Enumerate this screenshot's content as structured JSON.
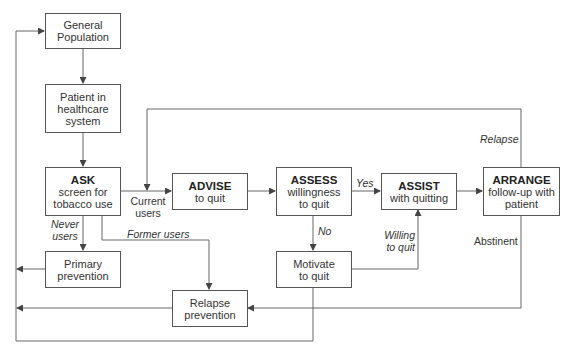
{
  "diagram": {
    "type": "flowchart",
    "nodes": {
      "general_population": {
        "line1": "General",
        "line2": "Population"
      },
      "patient": {
        "line1": "Patient in",
        "line2": "healthcare",
        "line3": "system"
      },
      "ask": {
        "title": "ASK",
        "line1": "screen for",
        "line2": "tobacco use"
      },
      "primary_prevention": {
        "line1": "Primary",
        "line2": "prevention"
      },
      "advise": {
        "title": "ADVISE",
        "line1": "to quit"
      },
      "relapse_prevention": {
        "line1": "Relapse",
        "line2": "prevention"
      },
      "assess": {
        "title": "ASSESS",
        "line1": "willingness",
        "line2": "to quit"
      },
      "motivate": {
        "line1": "Motivate",
        "line2": "to quit"
      },
      "assist": {
        "title": "ASSIST",
        "line1": "with quitting"
      },
      "arrange": {
        "title": "ARRANGE",
        "line1": "follow-up with",
        "line2": "patient"
      }
    },
    "edge_labels": {
      "current_users_1": "Current",
      "current_users_2": "users",
      "never_users_1": "Never",
      "never_users_2": "users",
      "former_users": "Former users",
      "yes": "Yes",
      "no": "No",
      "willing_1": "Willing",
      "willing_2": "to quit",
      "relapse": "Relapse",
      "abstinent": "Abstinent"
    },
    "edges": [
      {
        "from": "General Population",
        "to": "Patient in healthcare system"
      },
      {
        "from": "Patient in healthcare system",
        "to": "ASK"
      },
      {
        "from": "ASK",
        "to": "ADVISE",
        "label": "Current users"
      },
      {
        "from": "ASK",
        "to": "Primary prevention",
        "label": "Never users"
      },
      {
        "from": "ASK",
        "to": "Relapse prevention",
        "label": "Former users"
      },
      {
        "from": "ADVISE",
        "to": "ASSESS"
      },
      {
        "from": "ASSESS",
        "to": "ASSIST",
        "label": "Yes"
      },
      {
        "from": "ASSESS",
        "to": "Motivate to quit",
        "label": "No"
      },
      {
        "from": "Motivate to quit",
        "to": "ASSIST",
        "label": "Willing to quit"
      },
      {
        "from": "ASSIST",
        "to": "ARRANGE"
      },
      {
        "from": "ARRANGE",
        "to": "ASK (Current users)",
        "label": "Relapse"
      },
      {
        "from": "ARRANGE",
        "to": "Relapse prevention",
        "label": "Abstinent"
      },
      {
        "from": "Primary prevention",
        "to": "General Population"
      },
      {
        "from": "Relapse prevention",
        "to": "General Population"
      },
      {
        "from": "Motivate to quit",
        "to": "General Population"
      }
    ],
    "colors": {
      "line": "#555555",
      "text": "#333333",
      "background": "#ffffff"
    }
  }
}
